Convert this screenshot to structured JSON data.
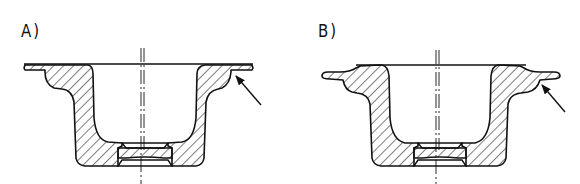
{
  "figure": {
    "panels": [
      {
        "id": "A",
        "label": "A)",
        "description": "Cross-section of deep-drawn cup with flat flange; arrow points to flange-to-wall transition"
      },
      {
        "id": "B",
        "label": "B)",
        "description": "Cross-section of deep-drawn cup with stepped/offset flange; arrow points to flange step"
      }
    ],
    "colors": {
      "line": "#111111",
      "background": "#ffffff"
    }
  }
}
